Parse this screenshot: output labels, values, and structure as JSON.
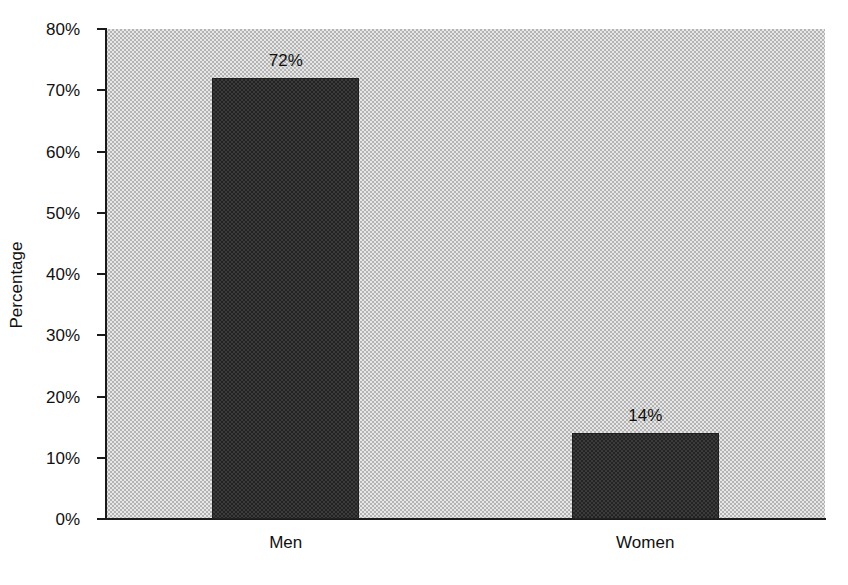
{
  "chart_data": {
    "type": "bar",
    "title": "",
    "subtitle": "",
    "xlabel": "",
    "ylabel": "Percentage",
    "categories": [
      "Men",
      "Women"
    ],
    "values": [
      72,
      14
    ],
    "value_labels": [
      "72%",
      "14%"
    ],
    "ylim": [
      0,
      80
    ],
    "ytick_values": [
      0,
      10,
      20,
      30,
      40,
      50,
      60,
      70,
      80
    ],
    "ytick_labels": [
      "0%",
      "10%",
      "20%",
      "30%",
      "40%",
      "50%",
      "60%",
      "70%",
      "80%"
    ],
    "grid": false,
    "legend": null,
    "legend_position": "none",
    "annotations": [],
    "series": [
      {
        "name": "Percentage",
        "values": [
          72,
          14
        ]
      }
    ],
    "colors": {
      "bar_fill": "#3b3b3b",
      "bar_edge": "#202020",
      "plot_background": "#c9c9c9",
      "figure_background": "#ffffff",
      "axis": "#1a1a1a",
      "text": "#111111"
    }
  }
}
